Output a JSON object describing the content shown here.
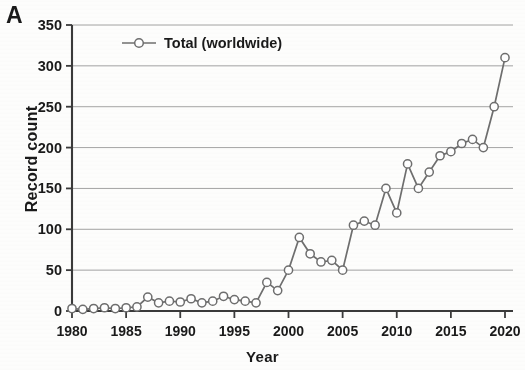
{
  "panel": {
    "label": "A"
  },
  "chart_data": {
    "type": "line",
    "title": "",
    "xlabel": "Year",
    "ylabel": "Record count",
    "xlim": [
      1980,
      2020
    ],
    "ylim": [
      0,
      350
    ],
    "ytick_labels": [
      "350",
      "300",
      "250",
      "200",
      "150",
      "100",
      "50",
      "0"
    ],
    "yticks": [
      350,
      300,
      250,
      200,
      150,
      100,
      50,
      0
    ],
    "xtick_labels": [
      "1980",
      "1985",
      "1990",
      "1995",
      "2000",
      "2005",
      "2010",
      "2015",
      "2020"
    ],
    "xticks": [
      1980,
      1985,
      1990,
      1995,
      2000,
      2005,
      2010,
      2015,
      2020
    ],
    "grid": "horizontal",
    "legend_position": "top-left",
    "marker": "open-circle",
    "line_color": "#6e6e6e",
    "marker_face_color": "#ffffff",
    "series": [
      {
        "name": "Total (worldwide)",
        "x": [
          1980,
          1981,
          1982,
          1983,
          1984,
          1985,
          1986,
          1987,
          1988,
          1989,
          1990,
          1991,
          1992,
          1993,
          1994,
          1995,
          1996,
          1997,
          1998,
          1999,
          2000,
          2001,
          2002,
          2003,
          2004,
          2005,
          2006,
          2007,
          2008,
          2009,
          2010,
          2011,
          2012,
          2013,
          2014,
          2015,
          2016,
          2017,
          2018,
          2019,
          2020
        ],
        "values": [
          3,
          2,
          3,
          4,
          3,
          4,
          5,
          17,
          10,
          12,
          11,
          15,
          10,
          12,
          18,
          14,
          12,
          10,
          35,
          25,
          50,
          90,
          70,
          60,
          62,
          50,
          105,
          110,
          105,
          150,
          120,
          180,
          150,
          170,
          190,
          195,
          205,
          210,
          200,
          250,
          310
        ]
      }
    ]
  }
}
